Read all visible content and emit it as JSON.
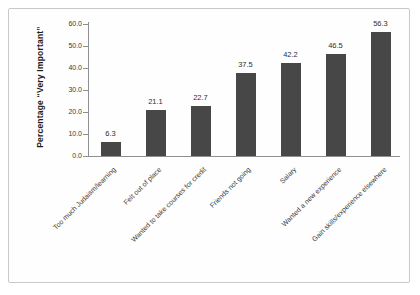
{
  "chart_data": {
    "type": "bar",
    "title": "",
    "ylabel": "Percentage “Very Important”",
    "xlabel": "",
    "categories": [
      "Too much Judaism/learning",
      "Felt out of place",
      "Wanted to take courses for credit",
      "Friends not going",
      "Salary",
      "Wanted a new experience",
      "Gain skills/experience elsewhere"
    ],
    "values": [
      6.3,
      21.1,
      22.7,
      37.5,
      42.2,
      46.5,
      56.3
    ],
    "value_labels": [
      "6.3",
      "21.1",
      "22.7",
      "37.5",
      "42.2",
      "46.5",
      "56.3"
    ],
    "yticks": [
      0,
      10,
      20,
      30,
      40,
      50,
      60
    ],
    "ytick_labels": [
      "0.0",
      "10.0",
      "20.0",
      "30.0",
      "40.0",
      "50.0",
      "60.0"
    ],
    "ylim": [
      0,
      60
    ],
    "grid": false,
    "legend": false,
    "category_label_rotation_deg": 45,
    "colors": {
      "bar": "#474747",
      "axis": "#909090",
      "text": "#3a3a3a",
      "frame_border": "#c9c9c9",
      "background": "#ffffff"
    }
  }
}
